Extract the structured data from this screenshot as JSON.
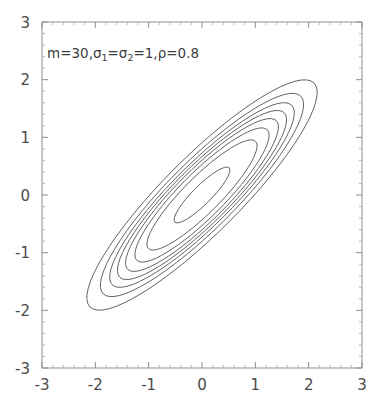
{
  "figure": {
    "name": "bivariate-normal-contour-plot",
    "background_color": "#ffffff",
    "frame_color": "#8f8f8f",
    "contour_color": "#5a5a5a",
    "label_color": "#4a4a4a"
  },
  "annotation": {
    "full_text": "m=30, σ₁=σ₂=1, ρ=0.8",
    "part_m": "m=30,",
    "part_sigma_sym": "σ",
    "part_sigma_sub1": "1",
    "part_eq1": "=",
    "part_sigma_sym2": "σ",
    "part_sigma_sub2": "2",
    "part_eq2": "=1,",
    "part_rho": "ρ=0.8",
    "m_value": 30,
    "sigma1": 1,
    "sigma2": 1,
    "rho": 0.8
  },
  "chart_data": {
    "type": "line",
    "title": "",
    "subtitle": "",
    "xlabel": "",
    "ylabel": "",
    "xlim": [
      -3,
      3
    ],
    "ylim": [
      -3,
      3
    ],
    "grid": false,
    "legend": "none",
    "x_ticks": [
      -3,
      -2,
      -1,
      0,
      1,
      2,
      3
    ],
    "y_ticks": [
      -3,
      -2,
      -1,
      0,
      1,
      2,
      3
    ],
    "x_tick_labels": [
      "-3",
      "-2",
      "-1",
      "0",
      "1",
      "2",
      "3"
    ],
    "y_tick_labels": [
      "-3",
      "-2",
      "-1",
      "0",
      "1",
      "2",
      "3"
    ],
    "minor_ticks_per_interval": 4,
    "center": [
      0,
      0
    ],
    "rotation_deg": -45,
    "contour_count": 8,
    "contours": [
      {
        "level": 1,
        "semi_major": 0.72,
        "semi_minor": 0.16
      },
      {
        "level": 2,
        "semi_major": 1.42,
        "semi_minor": 0.315
      },
      {
        "level": 3,
        "semi_major": 1.73,
        "semi_minor": 0.385
      },
      {
        "level": 4,
        "semi_major": 1.97,
        "semi_minor": 0.44
      },
      {
        "level": 5,
        "semi_major": 2.18,
        "semi_minor": 0.485
      },
      {
        "level": 6,
        "semi_major": 2.38,
        "semi_minor": 0.53
      },
      {
        "level": 7,
        "semi_major": 2.62,
        "semi_minor": 0.585
      },
      {
        "level": 8,
        "semi_major": 2.97,
        "semi_minor": 0.66
      }
    ]
  },
  "axes": {
    "x_axis_name": "x-axis",
    "y_axis_name": "y-axis",
    "plot_left_px": 42,
    "plot_right_px": 362,
    "plot_top_px": 22,
    "plot_bottom_px": 368
  }
}
